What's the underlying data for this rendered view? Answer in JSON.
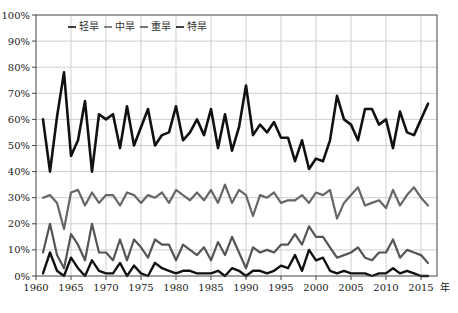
{
  "chart_data": {
    "type": "line",
    "title": "",
    "xlabel": "年",
    "ylabel": "",
    "ylim": [
      0,
      100
    ],
    "xlim": [
      1960,
      2017
    ],
    "grid": true,
    "legend_position": "top-left inside",
    "y_ticks": [
      "0%",
      "10%",
      "20%",
      "30%",
      "40%",
      "50%",
      "60%",
      "70%",
      "80%",
      "90%",
      "100%"
    ],
    "x_ticks": [
      "1960",
      "1965",
      "1970",
      "1975",
      "1980",
      "1985",
      "1990",
      "1995",
      "2000",
      "2005",
      "2010",
      "2015"
    ],
    "x_unit": "年",
    "x": [
      1961,
      1962,
      1963,
      1964,
      1965,
      1966,
      1967,
      1968,
      1969,
      1970,
      1971,
      1972,
      1973,
      1974,
      1975,
      1976,
      1977,
      1978,
      1979,
      1980,
      1981,
      1982,
      1983,
      1984,
      1985,
      1986,
      1987,
      1988,
      1989,
      1990,
      1991,
      1992,
      1993,
      1994,
      1995,
      1996,
      1997,
      1998,
      1999,
      2000,
      2001,
      2002,
      2003,
      2004,
      2005,
      2006,
      2007,
      2008,
      2009,
      2010,
      2011,
      2012,
      2013,
      2014,
      2015,
      2016
    ],
    "series": [
      {
        "name": "轻旱",
        "color": "#111111",
        "width": 2.6,
        "values": [
          60,
          40,
          61,
          78,
          46,
          52,
          67,
          40,
          62,
          60,
          62,
          49,
          65,
          50,
          57,
          64,
          50,
          54,
          55,
          65,
          52,
          55,
          60,
          54,
          64,
          49,
          62,
          48,
          57,
          73,
          54,
          58,
          55,
          59,
          53,
          53,
          44,
          52,
          41,
          45,
          44,
          52,
          69,
          60,
          58,
          52,
          64,
          64,
          58,
          60,
          49,
          63,
          55,
          54,
          60,
          66
        ]
      },
      {
        "name": "中旱",
        "color": "#666666",
        "width": 2.2,
        "values": [
          30,
          31,
          28,
          18,
          32,
          33,
          27,
          32,
          28,
          31,
          31,
          27,
          32,
          31,
          28,
          31,
          30,
          32,
          28,
          33,
          31,
          29,
          32,
          29,
          33,
          28,
          35,
          28,
          33,
          31,
          23,
          31,
          30,
          32,
          28,
          29,
          29,
          31,
          28,
          32,
          31,
          33,
          22,
          28,
          31,
          34,
          27,
          28,
          29,
          26,
          33,
          27,
          31,
          34,
          30,
          27
        ]
      },
      {
        "name": "重旱",
        "color": "#555555",
        "width": 2.2,
        "values": [
          9,
          20,
          8,
          3,
          16,
          12,
          6,
          20,
          9,
          9,
          6,
          14,
          6,
          14,
          11,
          7,
          14,
          12,
          12,
          6,
          12,
          10,
          8,
          11,
          6,
          13,
          8,
          15,
          9,
          3,
          11,
          9,
          10,
          9,
          12,
          12,
          16,
          12,
          19,
          15,
          15,
          11,
          7,
          8,
          9,
          11,
          7,
          6,
          9,
          9,
          14,
          7,
          10,
          9,
          8,
          5
        ]
      },
      {
        "name": "特旱",
        "color": "#111111",
        "width": 2.4,
        "values": [
          1,
          9,
          2,
          0,
          7,
          3,
          0,
          6,
          2,
          1,
          1,
          5,
          0,
          4,
          1,
          0,
          5,
          3,
          2,
          1,
          2,
          2,
          1,
          1,
          1,
          2,
          0,
          3,
          2,
          0,
          2,
          2,
          1,
          2,
          4,
          3,
          8,
          2,
          10,
          6,
          7,
          2,
          1,
          2,
          1,
          1,
          1,
          0,
          1,
          1,
          3,
          1,
          2,
          1,
          0,
          0
        ]
      }
    ]
  },
  "legend": {
    "items": [
      {
        "label": "轻旱",
        "color": "#111111"
      },
      {
        "label": "中旱",
        "color": "#666666"
      },
      {
        "label": "重旱",
        "color": "#555555"
      },
      {
        "label": "特旱",
        "color": "#111111"
      }
    ]
  },
  "axis": {
    "x_unit_label": "年"
  }
}
